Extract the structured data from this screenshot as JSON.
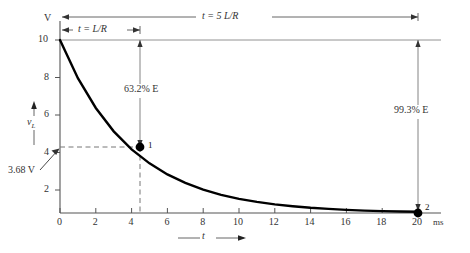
{
  "figure": {
    "y_axis_unit": "V",
    "y_axis_label_main": "v",
    "y_axis_label_sub": "L",
    "x_axis_label": "t",
    "x_axis_unit": "ms",
    "y_ticks": [
      "10",
      "8",
      "6",
      "4",
      "2"
    ],
    "x_ticks": [
      "0",
      "2",
      "4",
      "6",
      "8",
      "10",
      "12",
      "14",
      "16",
      "18",
      "20"
    ],
    "annotation_tau": "t = L/R",
    "annotation_5tau": "t = 5 L/R",
    "annotation_632": "63.2% E",
    "annotation_993": "99.3% E",
    "annotation_368": "3.68 V",
    "point_1_label": "1",
    "point_2_label": "2",
    "curve_color": "#000000",
    "axis_color": "#555555",
    "dash_color": "#777777"
  },
  "chart_data": {
    "type": "line",
    "title": "",
    "subtitle": "",
    "xlabel": "t",
    "ylabel": "v_L",
    "x_unit": "ms",
    "y_unit": "V",
    "xlim": [
      0,
      21.5
    ],
    "ylim": [
      0,
      10.6
    ],
    "grid": false,
    "legend": null,
    "x_ticks": [
      0,
      2,
      4,
      6,
      8,
      10,
      12,
      14,
      16,
      18,
      20
    ],
    "y_ticks": [
      2,
      4,
      6,
      8,
      10
    ],
    "series": [
      {
        "name": "v_L",
        "equation": "v_L = 10 e^(-t/4)",
        "x": [
          0,
          1,
          2,
          3,
          4,
          5,
          6,
          7,
          8,
          9,
          10,
          11,
          12,
          13,
          14,
          15,
          16,
          17,
          18,
          19,
          20
        ],
        "y": [
          10.0,
          7.79,
          6.07,
          4.72,
          3.68,
          2.87,
          2.23,
          1.74,
          1.35,
          1.05,
          0.82,
          0.64,
          0.5,
          0.39,
          0.3,
          0.24,
          0.18,
          0.14,
          0.11,
          0.09,
          0.07
        ]
      }
    ],
    "annotations": [
      {
        "text": "t = L/R",
        "type": "span-arrow",
        "x_from": 0,
        "x_to": 4,
        "y": 10.35
      },
      {
        "text": "t = 5 L/R",
        "type": "span-arrow",
        "x_from": 0,
        "x_to": 20,
        "y": 10.9
      },
      {
        "text": "63.2% E",
        "type": "vertical-arrow",
        "x": 4,
        "y_from": 10,
        "y_to": 3.68,
        "value": 6.32
      },
      {
        "text": "99.3% E",
        "type": "vertical-arrow",
        "x": 20,
        "y_from": 10,
        "y_to": 0.07,
        "value": 9.93
      },
      {
        "text": "3.68 V",
        "type": "point-arrow",
        "x": 0,
        "y": 3.68
      }
    ],
    "markers": [
      {
        "label": "1",
        "x": 4,
        "y": 3.68
      },
      {
        "label": "2",
        "x": 20,
        "y": 0.0
      }
    ]
  }
}
